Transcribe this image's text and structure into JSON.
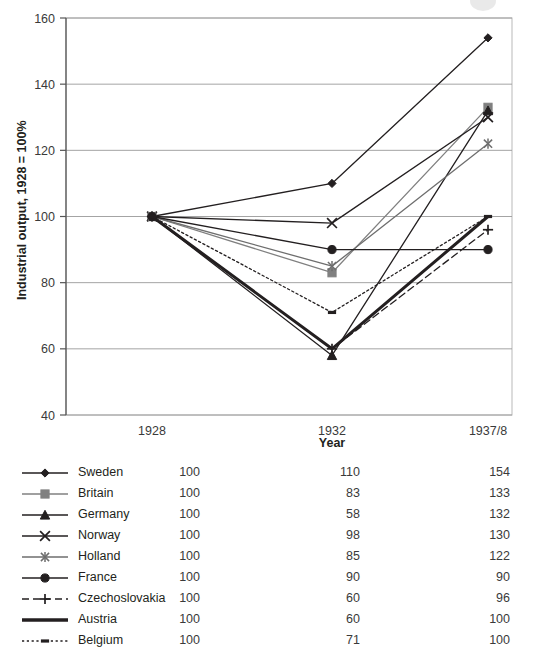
{
  "chart_data": {
    "type": "line",
    "title": "",
    "xlabel": "Year",
    "ylabel": "Industrial output, 1928 = 100%",
    "categories": [
      "1928",
      "1932",
      "1937/8"
    ],
    "ylim": [
      40,
      160
    ],
    "yticks": [
      40,
      60,
      80,
      100,
      120,
      140,
      160
    ],
    "grid": true,
    "legend_position": "below",
    "series": [
      {
        "name": "Sweden",
        "values": [
          100,
          110,
          154
        ],
        "marker": "diamond",
        "dash": "solid",
        "color": "#231f20",
        "width": 1.3
      },
      {
        "name": "Britain",
        "values": [
          100,
          83,
          133
        ],
        "marker": "square",
        "dash": "solid",
        "color": "#808080",
        "width": 1.3
      },
      {
        "name": "Germany",
        "values": [
          100,
          58,
          132
        ],
        "marker": "triangle",
        "dash": "solid",
        "color": "#231f20",
        "width": 1.3
      },
      {
        "name": "Norway",
        "values": [
          100,
          98,
          130
        ],
        "marker": "x",
        "dash": "solid",
        "color": "#231f20",
        "width": 1.3
      },
      {
        "name": "Holland",
        "values": [
          100,
          85,
          122
        ],
        "marker": "asterisk",
        "dash": "solid",
        "color": "#6e6e6e",
        "width": 1.3
      },
      {
        "name": "France",
        "values": [
          100,
          90,
          90
        ],
        "marker": "circle",
        "dash": "solid",
        "color": "#231f20",
        "width": 1.3
      },
      {
        "name": "Czechoslovakia",
        "values": [
          100,
          60,
          96
        ],
        "marker": "plus",
        "dash": "dashed",
        "color": "#231f20",
        "width": 1.3
      },
      {
        "name": "Austria",
        "values": [
          100,
          60,
          100
        ],
        "marker": "none",
        "dash": "solid",
        "color": "#231f20",
        "width": 3.0
      },
      {
        "name": "Belgium",
        "values": [
          100,
          71,
          100
        ],
        "marker": "dash",
        "dash": "dotted",
        "color": "#231f20",
        "width": 1.3
      }
    ]
  },
  "axis": {
    "y_title": "Industrial output, 1928 = 100%",
    "x_title": "Year",
    "y_ticks": [
      "160",
      "140",
      "120",
      "100",
      "80",
      "60",
      "40"
    ],
    "x_ticks": [
      "1928",
      "1932",
      "1937/8"
    ]
  },
  "legend": {
    "rows": [
      {
        "name": "Sweden",
        "v1": "100",
        "v2": "110",
        "v3": "154"
      },
      {
        "name": "Britain",
        "v1": "100",
        "v2": "83",
        "v3": "133"
      },
      {
        "name": "Germany",
        "v1": "100",
        "v2": "58",
        "v3": "132"
      },
      {
        "name": "Norway",
        "v1": "100",
        "v2": "98",
        "v3": "130"
      },
      {
        "name": "Holland",
        "v1": "100",
        "v2": "85",
        "v3": "122"
      },
      {
        "name": "France",
        "v1": "100",
        "v2": "90",
        "v3": "90"
      },
      {
        "name": "Czechoslovakia",
        "v1": "100",
        "v2": "60",
        "v3": "96"
      },
      {
        "name": "Austria",
        "v1": "100",
        "v2": "60",
        "v3": "100"
      },
      {
        "name": "Belgium",
        "v1": "100",
        "v2": "71",
        "v3": "100"
      }
    ]
  },
  "colors": {
    "ink": "#231f20",
    "grid": "#9a9a9a",
    "axis": "#6a6a6a",
    "gray_series": "#808080",
    "background": "#ffffff"
  }
}
